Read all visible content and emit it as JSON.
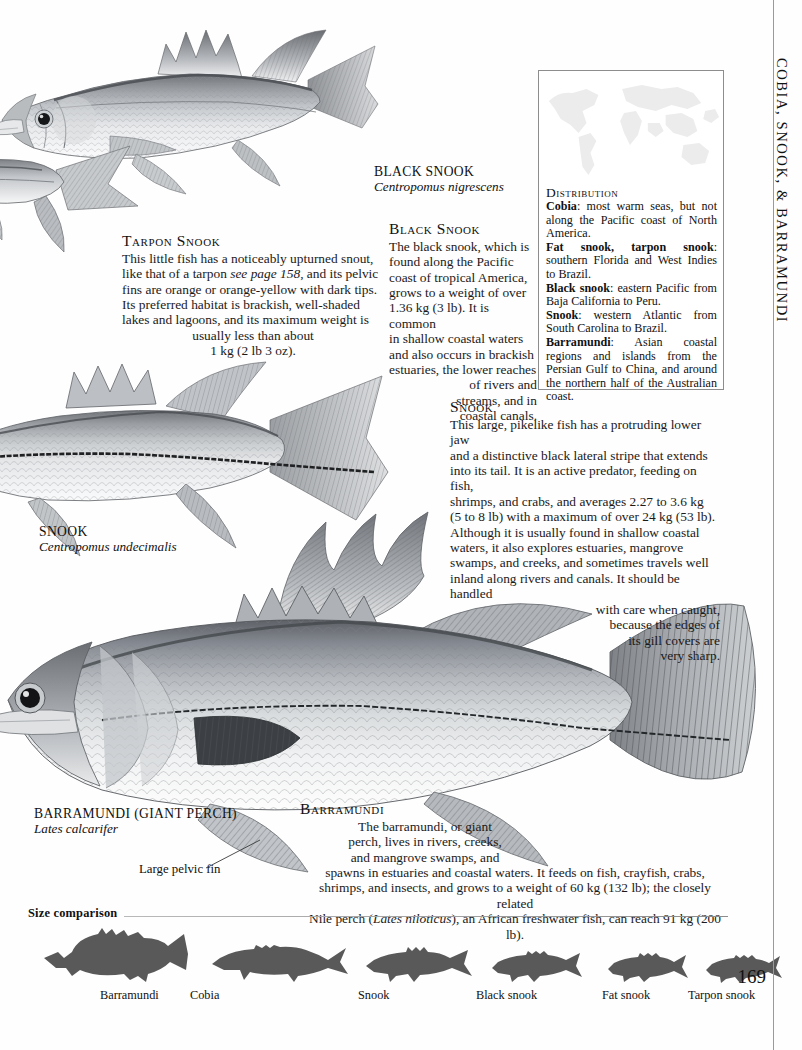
{
  "running_head": "COBIA, SNOOK, & BARRAMUNDI",
  "page_number": "169",
  "distribution": {
    "title": "Distribution",
    "entries": [
      {
        "name": "Cobia",
        "text": ": most warm seas, but not along the Pacific coast of North America."
      },
      {
        "name": "Fat snook, tarpon snook",
        "text": ": southern Florida and West Indies to Brazil."
      },
      {
        "name": "Black snook",
        "text": ": eastern Pacific from Baja California to Peru."
      },
      {
        "name": "Snook",
        "text": ": western Atlantic from South Carolina to Brazil."
      },
      {
        "name": "Barramundi",
        "text": ": Asian coastal regions and islands from the Persian Gulf to China, and around the northern half of the Australian coast."
      }
    ]
  },
  "captions": {
    "black_snook": {
      "name": "BLACK SNOOK",
      "latin": "Centropomus nigrescens"
    },
    "snook": {
      "name": "SNOOK",
      "latin": "Centropomus undecimalis"
    },
    "barramundi": {
      "name": "BARRAMUNDI (GIANT PERCH)",
      "latin": "Lates calcarifer"
    },
    "pelvic_callout": "Large pelvic fin"
  },
  "articles": {
    "tarpon_snook": {
      "heading": "Tarpon Snook",
      "lines": [
        "This little fish has a noticeably upturned snout,",
        "like that of a tarpon (see page 158), and its pelvic",
        "fins are orange or orange-yellow with dark tips.",
        "Its preferred habitat is brackish, well-shaded",
        "lakes and lagoons, and its maximum weight is"
      ],
      "centered_lines": [
        "usually less than about",
        "1 kg (2 lb 3 oz)."
      ],
      "italic_fragment": "see page 158"
    },
    "black_snook": {
      "heading": "Black Snook",
      "lines": [
        "The black snook, which is",
        "found along the Pacific",
        "coast of tropical America,",
        "grows to a weight of over",
        "1.36 kg (3 lb). It is common",
        "in shallow coastal waters",
        "and also occurs in brackish",
        "estuaries, the lower reaches"
      ],
      "indented_lines": [
        "of rivers and",
        "streams, and in",
        "coastal canals."
      ]
    },
    "snook": {
      "heading": "Snook",
      "lines": [
        "This large, pikelike fish has a protruding lower jaw",
        "and a distinctive black lateral stripe that extends",
        "into its tail. It is an active predator, feeding on fish,",
        "shrimps, and crabs, and averages 2.27 to 3.6 kg",
        "(5 to 8 lb) with a maximum of over 24 kg (53 lb).",
        "Although it is usually found in shallow coastal",
        "waters, it also explores estuaries, mangrove",
        "swamps, and creeks, and sometimes travels well",
        "inland along rivers and canals. It should be handled"
      ],
      "right_lines": [
        "with care when caught,",
        "because the edges of",
        "its gill covers are",
        "very sharp."
      ]
    },
    "barramundi": {
      "heading": "Barramundi",
      "centered_lines": [
        "The barramundi, or giant",
        "perch, lives in rivers, creeks,",
        "and mangrove swamps, and"
      ],
      "full_lines": [
        "spawns in estuaries and coastal waters. It feeds on fish, crayfish, crabs,",
        "shrimps, and insects, and grows to a weight of 60 kg (132 lb); the closely related",
        "Nile perch (Lates niloticus), an African freshwater fish, can reach 91 kg (200 lb)."
      ],
      "italic_fragment": "Lates niloticus"
    }
  },
  "size_comparison": {
    "label": "Size comparison",
    "items": [
      {
        "name": "Barramundi"
      },
      {
        "name": "Cobia"
      },
      {
        "name": "Snook"
      },
      {
        "name": "Black snook"
      },
      {
        "name": "Fat snook"
      },
      {
        "name": "Tarpon snook"
      }
    ]
  },
  "colors": {
    "page_background": "#fefefe",
    "text": "#111111",
    "silhouette": "#595959",
    "rule": "#8c8c8c",
    "box_border": "#8d8d8d",
    "map_watermark": "#ededed"
  }
}
